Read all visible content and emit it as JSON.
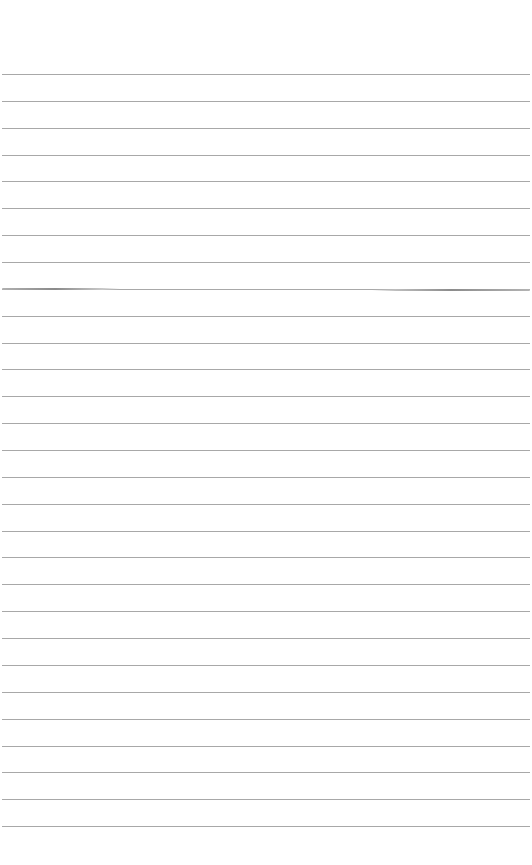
{
  "page": {
    "type": "lined-paper",
    "background_color": "#ffffff",
    "rule_color": "#a8a8a8",
    "rule_count": 29,
    "first_rule_y": 74,
    "rule_spacing": 26.86
  },
  "marks": [
    {
      "name": "left-smudge",
      "y": 289,
      "x_start": 2,
      "x_end": 120
    },
    {
      "name": "right-smudge",
      "y": 290,
      "x_start": 372,
      "x_end": 530
    }
  ]
}
